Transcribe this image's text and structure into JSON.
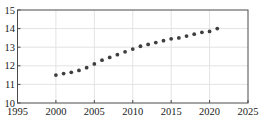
{
  "chart_data": {
    "type": "scatter",
    "title": "",
    "xlabel": "",
    "ylabel": "",
    "x": [
      2000,
      2001,
      2002,
      2003,
      2004,
      2005,
      2006,
      2007,
      2008,
      2009,
      2010,
      2011,
      2012,
      2013,
      2014,
      2015,
      2016,
      2017,
      2018,
      2019,
      2020,
      2021
    ],
    "series": [
      {
        "name": "values",
        "values": [
          11.5,
          11.58,
          11.65,
          11.75,
          11.9,
          12.1,
          12.3,
          12.45,
          12.6,
          12.75,
          12.9,
          13.05,
          13.15,
          13.25,
          13.35,
          13.45,
          13.5,
          13.6,
          13.7,
          13.8,
          13.85,
          14.0
        ]
      }
    ],
    "xlim": [
      1995,
      2025
    ],
    "ylim": [
      10,
      15
    ],
    "xticks": [
      1995,
      2000,
      2005,
      2010,
      2015,
      2020,
      2025
    ],
    "yticks": [
      10,
      11,
      12,
      13,
      14,
      15
    ],
    "grid": true,
    "legend": "none",
    "marker_shape": "circle",
    "marker_color": "#3f3f3f",
    "marker_radius": 1.9,
    "frame_color": "#4a4a4a",
    "grid_color": "#e3e3e3",
    "tick_color": "#4a4a4a",
    "label_color": "#1a1a1a",
    "background_color": "#ffffff",
    "plot_background_color": "#ffffff"
  },
  "layout_px": {
    "width": 262,
    "height": 121,
    "plot_left": 17.5,
    "plot_top": 10,
    "plot_right": 248,
    "plot_bottom": 103
  }
}
